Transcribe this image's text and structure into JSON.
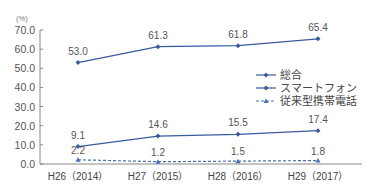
{
  "chart_data": {
    "type": "line",
    "title": "",
    "xlabel": "",
    "ylabel": "(%)",
    "ylim": [
      0,
      70
    ],
    "yticks": [
      "0.0",
      "10.0",
      "20.0",
      "30.0",
      "40.0",
      "50.0",
      "60.0",
      "70.0"
    ],
    "categories": [
      "H26（2014）",
      "H27（2015）",
      "H28（2016）",
      "H29（2017）"
    ],
    "series": [
      {
        "name": "総合",
        "values": [
          53.0,
          61.3,
          61.8,
          65.4
        ],
        "labels": [
          "53.0",
          "61.3",
          "61.8",
          "65.4"
        ],
        "style": "solid",
        "marker": "diamond",
        "color": "#3a5a9c"
      },
      {
        "name": "スマートフォン",
        "values": [
          9.1,
          14.6,
          15.5,
          17.4
        ],
        "labels": [
          "9.1",
          "14.6",
          "15.5",
          "17.4"
        ],
        "style": "solid",
        "marker": "diamond",
        "color": "#3a5a9c"
      },
      {
        "name": "従来型携帯電話",
        "values": [
          2.2,
          1.2,
          1.5,
          1.8
        ],
        "labels": [
          "2.2",
          "1.2",
          "1.5",
          "1.8"
        ],
        "style": "dashed",
        "marker": "triangle",
        "color": "#4a6cb0"
      }
    ],
    "legend": {
      "position": "right",
      "entries": [
        "総合",
        "スマートフォン",
        "従来型携帯電話"
      ]
    },
    "grid": false
  }
}
